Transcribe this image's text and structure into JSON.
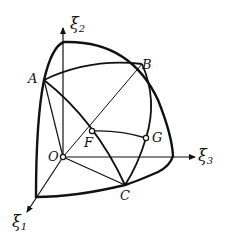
{
  "diagram": {
    "type": "spherical-triangle-octant",
    "axes": [
      {
        "id": "xi1",
        "symbol": "ξ",
        "subscript": "1"
      },
      {
        "id": "xi2",
        "symbol": "ξ",
        "subscript": "2"
      },
      {
        "id": "xi3",
        "symbol": "ξ",
        "subscript": "3"
      }
    ],
    "points": [
      {
        "id": "A",
        "label": "A"
      },
      {
        "id": "B",
        "label": "B"
      },
      {
        "id": "C",
        "label": "C"
      },
      {
        "id": "F",
        "label": "F"
      },
      {
        "id": "G",
        "label": "G"
      },
      {
        "id": "O",
        "label": "O"
      }
    ],
    "line_color": "#111111",
    "background": "#ffffff"
  }
}
